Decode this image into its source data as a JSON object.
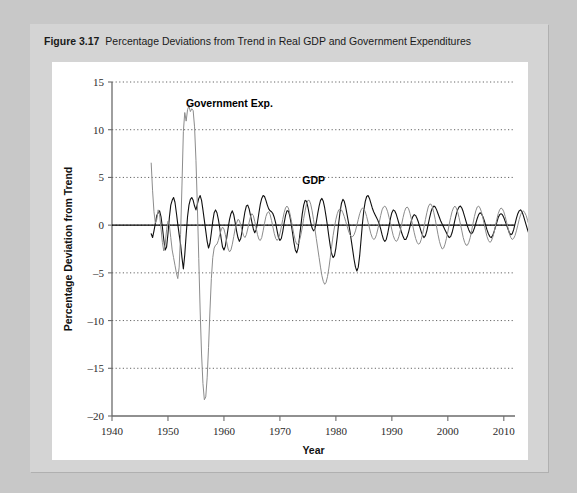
{
  "figure": {
    "label": "Figure 3.17",
    "caption": "Percentage Deviations from Trend in Real GDP and Government Expenditures"
  },
  "chart_data": {
    "type": "line",
    "title": "Percentage Deviations from Trend in Real GDP and Government Expenditures",
    "xlabel": "Year",
    "ylabel": "Percentage Deviation from Trend",
    "xlim": [
      1940,
      2012
    ],
    "ylim": [
      -20,
      15
    ],
    "xticks": [
      1940,
      1950,
      1960,
      1970,
      1980,
      1990,
      2000,
      2010
    ],
    "yticks": [
      -20,
      -15,
      -10,
      -5,
      0,
      5,
      10,
      15
    ],
    "grid": "horizontal-dotted",
    "zero_line": true,
    "legend": "inline-annotations",
    "annotations": [
      {
        "text": "Government Exp.",
        "x": 1953.2,
        "y": 12.4
      },
      {
        "text": "GDP",
        "x": 1974.0,
        "y": 4.3
      }
    ],
    "x_start": 1947.0,
    "x_step": 0.25,
    "series": [
      {
        "name": "GDP",
        "color": "#101010",
        "width": 1.1,
        "values": [
          -0.9,
          -1.3,
          -0.6,
          0.2,
          1.0,
          1.3,
          1.5,
          0.9,
          -0.2,
          -1.5,
          -2.6,
          -2.3,
          -0.9,
          0.8,
          2.1,
          2.6,
          2.9,
          2.4,
          1.3,
          0.1,
          -1.0,
          -2.0,
          -3.4,
          -4.6,
          -3.1,
          -1.0,
          0.9,
          2.1,
          2.7,
          2.9,
          2.6,
          2.0,
          1.6,
          2.2,
          2.8,
          3.1,
          2.6,
          1.6,
          0.5,
          -0.6,
          -1.7,
          -2.4,
          -1.9,
          -0.8,
          0.4,
          1.3,
          1.6,
          1.3,
          0.6,
          -0.3,
          -1.4,
          -2.3,
          -2.6,
          -2.2,
          -1.3,
          -0.3,
          0.6,
          1.2,
          1.5,
          1.1,
          0.3,
          -0.6,
          -1.3,
          -1.7,
          -1.4,
          -0.6,
          0.5,
          1.4,
          2.0,
          2.1,
          1.7,
          1.0,
          0.3,
          -0.4,
          -0.8,
          -0.5,
          0.3,
          1.3,
          2.2,
          2.8,
          3.1,
          3.0,
          2.6,
          2.1,
          1.7,
          1.5,
          1.4,
          1.2,
          0.8,
          0.2,
          -0.6,
          -1.3,
          -1.6,
          -1.4,
          -0.7,
          0.2,
          1.0,
          1.5,
          1.5,
          1.0,
          0.2,
          -0.8,
          -1.8,
          -2.6,
          -2.9,
          -2.4,
          -1.3,
          0.0,
          1.2,
          2.1,
          2.6,
          2.5,
          1.9,
          1.1,
          0.3,
          -0.3,
          -0.6,
          -0.4,
          0.3,
          1.2,
          2.0,
          2.6,
          2.8,
          2.5,
          1.8,
          0.9,
          -0.1,
          -1.2,
          -2.2,
          -3.0,
          -3.4,
          -3.2,
          -2.4,
          -1.2,
          0.2,
          1.4,
          2.3,
          2.7,
          2.5,
          1.9,
          1.1,
          0.3,
          -0.6,
          -1.6,
          -2.6,
          -3.6,
          -4.4,
          -4.8,
          -4.4,
          -3.2,
          -1.5,
          0.2,
          1.6,
          2.5,
          3.0,
          3.1,
          2.8,
          2.3,
          1.8,
          1.4,
          1.1,
          0.8,
          0.5,
          0.1,
          -0.4,
          -1.0,
          -1.5,
          -1.7,
          -1.5,
          -0.9,
          -0.1,
          0.7,
          1.3,
          1.6,
          1.5,
          1.2,
          0.7,
          0.2,
          -0.3,
          -0.8,
          -1.2,
          -1.5,
          -1.5,
          -1.2,
          -0.7,
          -0.1,
          0.5,
          0.9,
          1.1,
          1.0,
          0.7,
          0.3,
          -0.2,
          -0.7,
          -1.1,
          -1.3,
          -1.1,
          -0.6,
          0.1,
          0.8,
          1.4,
          1.8,
          2.0,
          1.9,
          1.6,
          1.2,
          0.8,
          0.4,
          0.1,
          -0.2,
          -0.5,
          -0.8,
          -1.1,
          -1.3,
          -1.2,
          -0.8,
          -0.2,
          0.5,
          1.1,
          1.6,
          1.9,
          2.0,
          1.8,
          1.4,
          0.9,
          0.4,
          -0.1,
          -0.5,
          -0.8,
          -0.9,
          -0.7,
          -0.3,
          0.2,
          0.7,
          1.1,
          1.3,
          1.2,
          0.9,
          0.5,
          0.0,
          -0.5,
          -0.9,
          -1.2,
          -1.3,
          -1.1,
          -0.7,
          -0.2,
          0.3,
          0.8,
          1.1,
          1.2,
          1.1,
          0.8,
          0.4,
          0.0,
          -0.4,
          -0.8,
          -1.0,
          -0.9,
          -0.5,
          0.1,
          0.7,
          1.2,
          1.5,
          1.6,
          1.4,
          1.0,
          0.5,
          0.0,
          -0.5,
          -0.9,
          -1.1,
          -1.0,
          -0.6,
          0.0,
          0.6,
          1.1,
          1.4,
          1.5,
          1.3,
          0.9,
          0.4,
          -0.2,
          -0.8,
          -1.4,
          -2.0,
          -2.6,
          -3.2,
          -3.8,
          -4.1,
          -4.0
        ]
      },
      {
        "name": "Government Exp.",
        "color": "#8c8c8c",
        "width": 1.0,
        "values": [
          6.5,
          3.6,
          1.4,
          0.2,
          0.6,
          1.6,
          1.1,
          -0.3,
          -1.8,
          -2.7,
          -2.0,
          -0.5,
          0.4,
          0.0,
          -1.3,
          -2.6,
          -3.4,
          -4.2,
          -5.0,
          -5.6,
          -4.4,
          -1.0,
          4.2,
          9.8,
          11.8,
          10.9,
          12.1,
          12.5,
          11.9,
          12.2,
          12.0,
          10.3,
          6.8,
          2.0,
          -3.5,
          -9.0,
          -13.5,
          -16.6,
          -18.3,
          -18.0,
          -16.0,
          -12.8,
          -9.0,
          -5.6,
          -3.4,
          -2.4,
          -2.1,
          -2.0,
          -1.6,
          -1.0,
          -0.5,
          -0.2,
          -0.4,
          -1.0,
          -1.8,
          -2.5,
          -2.8,
          -2.6,
          -2.0,
          -1.2,
          -0.4,
          0.2,
          0.6,
          0.5,
          0.0,
          -0.6,
          -1.1,
          -1.3,
          -1.0,
          -0.4,
          0.3,
          0.9,
          1.2,
          1.0,
          0.4,
          -0.3,
          -1.0,
          -1.5,
          -1.6,
          -1.3,
          -0.6,
          0.2,
          0.9,
          1.3,
          1.4,
          1.1,
          0.5,
          -0.2,
          -0.9,
          -1.4,
          -1.6,
          -1.4,
          -0.9,
          -0.2,
          0.6,
          1.3,
          1.8,
          2.0,
          1.8,
          1.3,
          0.6,
          -0.2,
          -1.0,
          -1.6,
          -2.0,
          -2.0,
          -1.6,
          -1.0,
          -0.2,
          0.7,
          1.5,
          2.2,
          2.6,
          2.6,
          2.2,
          1.5,
          0.6,
          -0.4,
          -1.4,
          -2.4,
          -3.4,
          -4.4,
          -5.3,
          -5.9,
          -6.2,
          -6.0,
          -5.4,
          -4.5,
          -3.4,
          -2.2,
          -1.1,
          -0.2,
          0.6,
          1.2,
          1.6,
          1.7,
          1.6,
          1.3,
          0.9,
          0.4,
          -0.1,
          -0.6,
          -1.0,
          -1.2,
          -1.2,
          -1.0,
          -0.6,
          0.0,
          0.6,
          1.2,
          1.6,
          1.8,
          1.7,
          1.4,
          0.9,
          0.3,
          -0.3,
          -0.9,
          -1.3,
          -1.5,
          -1.4,
          -1.0,
          -0.4,
          0.3,
          1.0,
          1.6,
          1.9,
          2.0,
          1.8,
          1.4,
          0.8,
          0.2,
          -0.5,
          -1.1,
          -1.5,
          -1.7,
          -1.6,
          -1.2,
          -0.6,
          0.1,
          0.8,
          1.4,
          1.8,
          1.9,
          1.7,
          1.2,
          0.6,
          -0.1,
          -0.8,
          -1.4,
          -1.8,
          -2.0,
          -1.9,
          -1.5,
          -0.9,
          -0.2,
          0.6,
          1.3,
          1.9,
          2.2,
          2.2,
          1.9,
          1.3,
          0.6,
          -0.2,
          -1.0,
          -1.7,
          -2.2,
          -2.5,
          -2.4,
          -2.0,
          -1.4,
          -0.7,
          0.1,
          0.8,
          1.4,
          1.8,
          2.0,
          1.8,
          1.4,
          0.8,
          0.1,
          -0.6,
          -1.3,
          -1.8,
          -2.1,
          -2.1,
          -1.8,
          -1.3,
          -0.6,
          0.2,
          0.9,
          1.5,
          1.9,
          2.0,
          1.8,
          1.4,
          0.8,
          0.1,
          -0.6,
          -1.2,
          -1.6,
          -1.8,
          -1.7,
          -1.3,
          -0.8,
          -0.1,
          0.6,
          1.2,
          1.6,
          1.8,
          1.7,
          1.4,
          0.9,
          0.3,
          -0.3,
          -0.9,
          -1.3,
          -1.5,
          -1.4,
          -1.1,
          -0.6,
          0.0,
          0.6,
          1.1,
          1.4,
          1.5,
          1.3,
          1.0,
          0.5,
          0.0,
          -0.5,
          -0.9,
          -1.1,
          -1.1,
          -0.8,
          -0.4,
          0.1,
          0.6,
          1.0,
          1.2,
          1.2,
          1.1,
          0.9,
          0.7,
          0.6,
          0.6,
          0.7,
          0.9,
          1.0,
          1.0
        ]
      }
    ]
  }
}
